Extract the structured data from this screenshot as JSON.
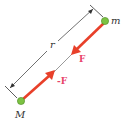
{
  "diagram": {
    "colors": {
      "force_arrow": "#e8402a",
      "force_label": "#e8446a",
      "mass_fill": "#7cc243",
      "mass_stroke": "#4a8a22",
      "dimension_line": "#333333",
      "background": "#ffffff"
    },
    "masses": [
      {
        "id": "small",
        "label": "m",
        "x": 105,
        "y": 21
      },
      {
        "id": "large",
        "label": "M",
        "x": 21,
        "y": 101
      }
    ],
    "distance": {
      "label": "r"
    },
    "forces": [
      {
        "id": "on-m",
        "label": "F",
        "from": "m",
        "toward": "M"
      },
      {
        "id": "on-M",
        "label": "-F",
        "from": "M",
        "toward": "m"
      }
    ]
  }
}
